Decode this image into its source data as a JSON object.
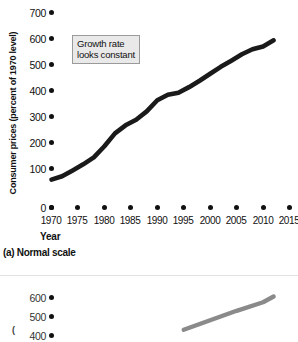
{
  "figure": {
    "panel_a": {
      "caption": "(a) Normal scale",
      "ylabel": "Consumer prices (percent of 1970 level)",
      "xlabel": "Year",
      "annotation": "Growth rate looks constant",
      "annotation_line1": "Growth rate",
      "annotation_line2": "looks constant",
      "line_color": "#1a1a1a",
      "annotation_fill": "#e9e9e9",
      "annotation_border": "#9a9a9a"
    },
    "panel_b": {
      "ylabel_fragment": "400",
      "line_color": "#8a8a8a"
    }
  },
  "chart_data": [
    {
      "type": "line",
      "title": "(a) Normal scale",
      "xlabel": "Year",
      "ylabel": "Consumer prices (percent of 1970 level)",
      "xlim": [
        1970,
        2015
      ],
      "ylim": [
        0,
        700
      ],
      "yticks": [
        0,
        100,
        200,
        300,
        400,
        500,
        600,
        700
      ],
      "xticks": [
        1970,
        1975,
        1980,
        1985,
        1990,
        1995,
        2000,
        2005,
        2010,
        2015
      ],
      "grid": false,
      "legend": null,
      "annotations": [
        {
          "text": "Growth rate looks constant",
          "x": 1978,
          "y": 540
        }
      ],
      "series": [
        {
          "name": "Consumer prices",
          "x": [
            1970,
            1972,
            1974,
            1976,
            1978,
            1980,
            1982,
            1984,
            1986,
            1988,
            1990,
            1992,
            1994,
            1996,
            1998,
            2000,
            2002,
            2004,
            2006,
            2008,
            2010,
            2012
          ],
          "values": [
            100,
            112,
            133,
            155,
            180,
            220,
            266,
            295,
            315,
            345,
            385,
            405,
            412,
            432,
            455,
            480,
            505,
            527,
            550,
            568,
            578,
            600
          ]
        }
      ]
    },
    {
      "type": "line",
      "title": "(b) Logarithmic scale",
      "ylabel": "",
      "yticks": [
        400,
        500,
        600
      ],
      "ylim": [
        400,
        650
      ],
      "grid": false,
      "series": [
        {
          "name": "Consumer prices",
          "x": [
            1995,
            2000,
            2005,
            2010,
            2012
          ],
          "values": [
            430,
            480,
            530,
            575,
            605
          ]
        }
      ]
    }
  ]
}
